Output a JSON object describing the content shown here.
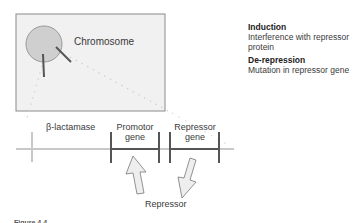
{
  "diagram": {
    "cell_label": "Chromosome",
    "segments": [
      {
        "label": "β-lactamase"
      },
      {
        "label_line1": "Promotor",
        "label_line2": "gene"
      },
      {
        "label_line1": "Repressor",
        "label_line2": "gene"
      }
    ],
    "repressor_label": "Repressor",
    "caption": "Figure 4.4"
  },
  "legend": {
    "items": [
      {
        "title": "Induction",
        "description_line1": "Interference with repressor",
        "description_line2": "protein"
      },
      {
        "title": "De-repression",
        "description_line1": "Mutation in repressor gene"
      }
    ]
  },
  "colors": {
    "box_fill": "#f1f1f1",
    "box_border": "#8a8a8a",
    "circle_fill": "#cfcfcf",
    "dark_line": "#555555",
    "light_line": "#c8c8c8",
    "dotted": "#d0d0d0",
    "arrow_fill": "#eeeeee"
  }
}
